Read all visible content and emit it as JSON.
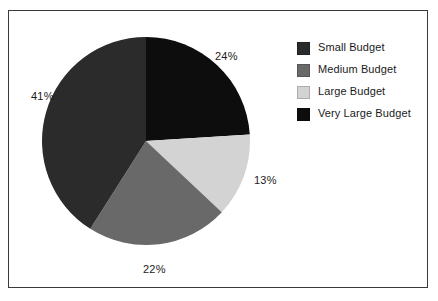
{
  "chart_data": {
    "type": "pie",
    "title": "",
    "subtitle": "",
    "xlabel": "",
    "ylabel": "",
    "grid": false,
    "legend_position": "right",
    "start_angle_deg": 0,
    "direction": "clockwise",
    "categories": [
      "Very Large Budget",
      "Large Budget",
      "Medium Budget",
      "Small Budget"
    ],
    "values": [
      24,
      13,
      22,
      41
    ],
    "value_unit": "%",
    "data_labels": [
      "24%",
      "13%",
      "22%",
      "41%"
    ],
    "colors": [
      "#0d0d0d",
      "#d3d3d3",
      "#696969",
      "#2b2b2b"
    ],
    "slices": [
      {
        "label": "Very Large Budget",
        "value": 24,
        "display": "24%",
        "color": "#0d0d0d"
      },
      {
        "label": "Large Budget",
        "value": 13,
        "display": "13%",
        "color": "#d3d3d3"
      },
      {
        "label": "Medium Budget",
        "value": 22,
        "display": "22%",
        "color": "#696969"
      },
      {
        "label": "Small Budget",
        "value": 41,
        "display": "41%",
        "color": "#2b2b2b"
      }
    ]
  },
  "labels": {
    "very_large": "24%",
    "large": "13%",
    "medium": "22%",
    "small": "41%"
  },
  "legend": {
    "items": [
      {
        "label": "Small Budget",
        "color": "#2b2b2b"
      },
      {
        "label": "Medium Budget",
        "color": "#696969"
      },
      {
        "label": "Large Budget",
        "color": "#d3d3d3"
      },
      {
        "label": "Very Large Budget",
        "color": "#0d0d0d"
      }
    ]
  },
  "style": {
    "border_color": "#3a3a3a",
    "background": "#ffffff",
    "text_color": "#1a1a1a"
  }
}
